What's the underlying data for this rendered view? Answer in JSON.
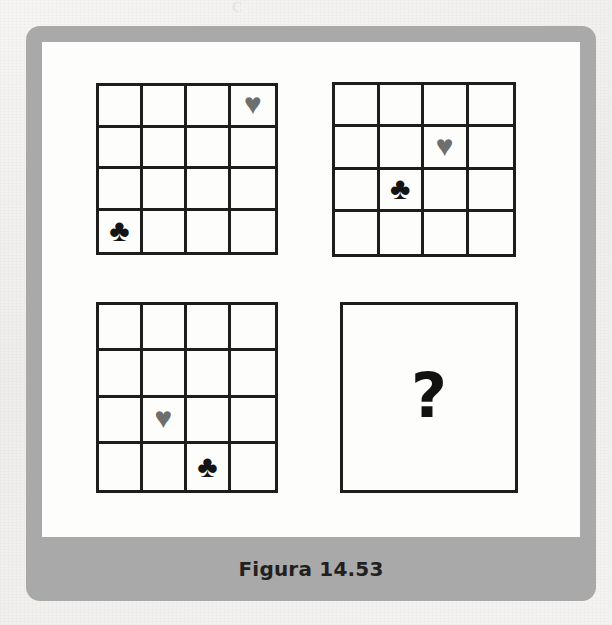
{
  "figure": {
    "caption": "Figura 14.53",
    "frame_color": "#a9a9a9",
    "canvas_color": "#fdfdfc",
    "line_color": "#1d1d1b"
  },
  "symbols": {
    "heart": {
      "glyph": "♥",
      "name": "heart-symbol",
      "color": "#6e6e6e"
    },
    "club": {
      "glyph": "♣",
      "name": "club-symbol",
      "color": "#141414"
    },
    "empty": {
      "glyph": "",
      "name": "empty-cell",
      "color": ""
    }
  },
  "panels": [
    {
      "id": "panel-1",
      "label": "Matriz 1",
      "rows": 4,
      "columns": 4,
      "cells": [
        [
          "",
          "",
          "",
          "heart"
        ],
        [
          "",
          "",
          "",
          ""
        ],
        [
          "",
          "",
          "",
          ""
        ],
        [
          "club",
          "",
          "",
          ""
        ]
      ]
    },
    {
      "id": "panel-2",
      "label": "Matriz 2",
      "rows": 4,
      "columns": 4,
      "cells": [
        [
          "",
          "",
          "",
          ""
        ],
        [
          "",
          "",
          "heart",
          ""
        ],
        [
          "",
          "club",
          "",
          ""
        ],
        [
          "",
          "",
          "",
          ""
        ]
      ]
    },
    {
      "id": "panel-3",
      "label": "Matriz 3",
      "rows": 4,
      "columns": 4,
      "cells": [
        [
          "",
          "",
          "",
          ""
        ],
        [
          "",
          "",
          "",
          ""
        ],
        [
          "",
          "heart",
          "",
          ""
        ],
        [
          "",
          "",
          "club",
          ""
        ]
      ]
    }
  ],
  "answer_panel": {
    "id": "panel-4",
    "label": "Matriz incognita",
    "question_mark": "?"
  },
  "ghost_text": {
    "a": "C",
    "b": "C",
    "c": "D  D  8",
    "d": "RAVE EMMA 50 - 200 F",
    "e": "DIPOS Bottles",
    "f": "1887"
  }
}
